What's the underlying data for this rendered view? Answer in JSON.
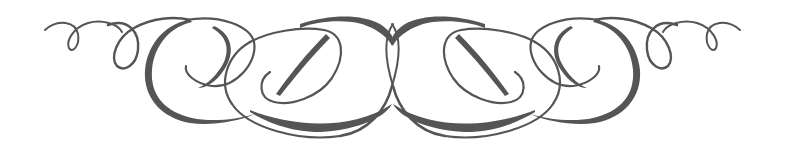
{
  "ornament": {
    "description": "Symmetric calligraphic flourish divider",
    "stroke_color": "#555555",
    "background_color": "#ffffff",
    "symmetry_axis_x": 392.5
  }
}
